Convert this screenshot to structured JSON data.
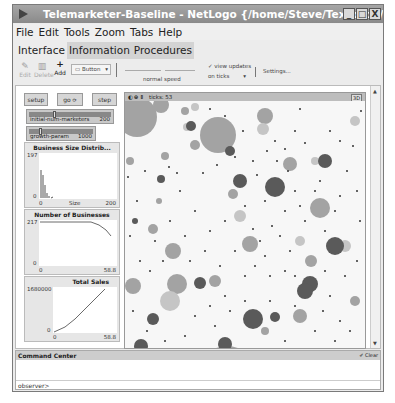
{
  "window": {
    "title": "Telemarketer-Baseline - NetLogo {/home/Steve/Textbook/Ch13}",
    "controls": [
      "_",
      "□",
      "X"
    ]
  },
  "menu": [
    "File",
    "Edit",
    "Tools",
    "Zoom",
    "Tabs",
    "Help"
  ],
  "tabs": [
    {
      "label": "Interface",
      "active": true
    },
    {
      "label": "Information",
      "active": false
    },
    {
      "label": "Procedures",
      "active": false
    }
  ],
  "toolbar": {
    "edit_label": "Edit",
    "delete_label": "Delete",
    "add_label": "Add",
    "widget_select": "Button",
    "speed_label": "normal speed",
    "view_updates_label": "view updates",
    "update_mode": "on ticks",
    "settings_label": "Settings..."
  },
  "widgets": {
    "setup_label": "setup",
    "go_label": "go",
    "step_label": "step",
    "sliders": [
      {
        "name": "initial-num-marketers",
        "value": "200"
      },
      {
        "name": "growth-param",
        "value": "1000"
      }
    ]
  },
  "plots": [
    {
      "title": "Business Size Distrib...",
      "ymax": "197",
      "ymin": "0",
      "xmin": "0",
      "xmax": "200",
      "xlabel": "Size"
    },
    {
      "title": "Number of Businesses",
      "ymax": "217",
      "ymin": "0",
      "xmin": "0",
      "xmax": "58.8"
    },
    {
      "title": "Total Sales",
      "ymax": "1680000",
      "ymin": "0",
      "xmin": "0",
      "xmax": "58.8"
    }
  ],
  "view": {
    "ticks_label": "ticks: 53",
    "three_d_label": "3D"
  },
  "command_center": {
    "title": "Command Center",
    "clear_label": "Clear",
    "prompt": "observer>"
  },
  "colors": {
    "titlebar": "#999999",
    "window_bg": "#ececec",
    "world_bg": "#f7f7f7"
  }
}
